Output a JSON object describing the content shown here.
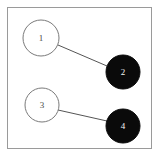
{
  "figure": {
    "type": "node-link-graph",
    "background_color": "#ffffff",
    "frame": {
      "visible": true,
      "border_color": "#9a9a9a",
      "border_width": 1,
      "x": 7,
      "y": 7,
      "width": 145,
      "height": 142
    }
  },
  "chart_data": {
    "type": "scatter",
    "title": "",
    "xlabel": "",
    "ylabel": "",
    "grid": false,
    "legend": null,
    "nodes": [
      {
        "id": "1",
        "label": "1",
        "x": 41,
        "y": 38,
        "radius": 18,
        "fill": "#ffffff",
        "stroke": "#7a7a7a",
        "stroke_width": 1,
        "label_color": "#4a4a4a",
        "style": "open"
      },
      {
        "id": "2",
        "label": "2",
        "x": 123,
        "y": 72,
        "radius": 17,
        "fill": "#0a0a0a",
        "stroke": "#0a0a0a",
        "stroke_width": 1,
        "label_color": "#f2f2f2",
        "style": "filled"
      },
      {
        "id": "3",
        "label": "3",
        "x": 42,
        "y": 105,
        "radius": 17,
        "fill": "#ffffff",
        "stroke": "#7a7a7a",
        "stroke_width": 1,
        "label_color": "#4a4a4a",
        "style": "open"
      },
      {
        "id": "4",
        "label": "4",
        "x": 123,
        "y": 126,
        "radius": 17,
        "fill": "#0a0a0a",
        "stroke": "#0a0a0a",
        "stroke_width": 1,
        "label_color": "#f2f2f2",
        "style": "filled"
      }
    ],
    "edges": [
      {
        "id": "edge-1-2",
        "source": "1",
        "target": "2",
        "x1": 58,
        "y1": 45,
        "x2": 107,
        "y2": 66,
        "color": "#555555",
        "width": 1
      },
      {
        "id": "edge-3-4",
        "source": "3",
        "target": "4",
        "x1": 58,
        "y1": 110,
        "x2": 107,
        "y2": 121,
        "color": "#555555",
        "width": 1
      }
    ]
  }
}
